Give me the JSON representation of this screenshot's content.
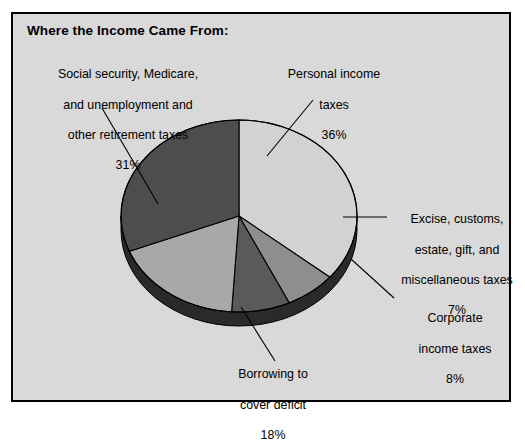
{
  "chart": {
    "title": "Where the Income Came From:"
  },
  "chart_data": {
    "type": "pie",
    "title": "Where the Income Came From:",
    "xlabel": "",
    "ylabel": "",
    "legend_position": "none",
    "grid": false,
    "units": "percent of total federal income",
    "categories": [
      "Personal income taxes",
      "Excise, customs, estate, gift, and miscellaneous taxes",
      "Corporate income taxes",
      "Borrowing to cover deficit",
      "Social security, Medicare, and unemployment and other retirement taxes"
    ],
    "values": [
      36,
      7,
      8,
      18,
      31
    ],
    "slices": [
      {
        "id": "personal",
        "name": "Personal income taxes",
        "label_lines": [
          "Personal income",
          "taxes"
        ],
        "value": 36,
        "value_text": "36%",
        "color": "#d2d2d2"
      },
      {
        "id": "excise",
        "name": "Excise, customs, estate, gift, and miscellaneous taxes",
        "label_lines": [
          "Excise, customs,",
          "estate, gift, and",
          "miscellaneous taxes"
        ],
        "value": 7,
        "value_text": "7%",
        "color": "#8e8e8e"
      },
      {
        "id": "corporate",
        "name": "Corporate income taxes",
        "label_lines": [
          "Corporate",
          "income taxes"
        ],
        "value": 8,
        "value_text": "8%",
        "color": "#5a5a5a"
      },
      {
        "id": "borrowing",
        "name": "Borrowing to cover deficit",
        "label_lines": [
          "Borrowing to",
          "cover deficit"
        ],
        "value": 18,
        "value_text": "18%",
        "color": "#a8a8a8"
      },
      {
        "id": "social",
        "name": "Social security, Medicare, and unemployment and other retirement taxes",
        "label_lines": [
          "Social security, Medicare,",
          "and unemployment and",
          "other retirement taxes"
        ],
        "value": 31,
        "value_text": "31%",
        "color": "#4d4d4d"
      }
    ]
  },
  "labels": {
    "social": {
      "l1": "Social security, Medicare,",
      "l2": "and unemployment and",
      "l3": "other retirement taxes",
      "pct": "31%"
    },
    "personal": {
      "l1": "Personal income",
      "l2": "taxes",
      "pct": "36%"
    },
    "excise": {
      "l1": "Excise, customs,",
      "l2": "estate, gift, and",
      "l3": "miscellaneous taxes",
      "pct": "7%"
    },
    "corporate": {
      "l1": "Corporate",
      "l2": "income taxes",
      "pct": "8%"
    },
    "borrowing": {
      "l1": "Borrowing to",
      "l2": "cover deficit",
      "pct": "18%"
    }
  },
  "colors": {
    "panel_bg": "#d9d9d9",
    "page_bg": "#ffffff",
    "outline": "#000000",
    "pie_side": "#2a2a2a"
  }
}
